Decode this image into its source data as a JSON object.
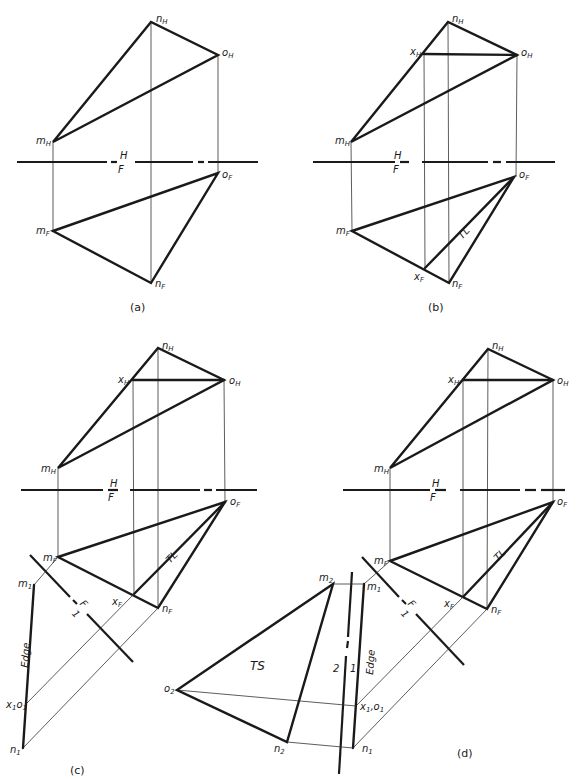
{
  "figure": {
    "panels": [
      {
        "id": "a",
        "caption": "(a)",
        "fold_line": {
          "upper": "H",
          "lower": "F"
        },
        "points": {
          "m_H": "m_H",
          "n_H": "n_H",
          "o_H": "o_H",
          "m_F": "m_F",
          "n_F": "n_F",
          "o_F": "o_F"
        }
      },
      {
        "id": "b",
        "caption": "(b)",
        "fold_line": {
          "upper": "H",
          "lower": "F"
        },
        "points": {
          "m_H": "m_H",
          "n_H": "n_H",
          "o_H": "o_H",
          "x_H": "x_H",
          "m_F": "m_F",
          "n_F": "n_F",
          "o_F": "o_F",
          "x_F": "x_F"
        },
        "annotations": {
          "true_length": "TL"
        }
      },
      {
        "id": "c",
        "caption": "(c)",
        "fold_line": {
          "upper": "H",
          "lower": "F"
        },
        "fold_line_aux": {
          "upper": "F",
          "lower": "1"
        },
        "points": {
          "m_H": "m_H",
          "n_H": "n_H",
          "o_H": "o_H",
          "x_H": "x_H",
          "m_F": "m_F",
          "n_F": "n_F",
          "o_F": "o_F",
          "x_F": "x_F",
          "m_1": "m_1",
          "x1o1": "x_1o_1",
          "n_1": "n_1"
        },
        "annotations": {
          "true_length": "TL",
          "edge": "Edge"
        }
      },
      {
        "id": "d",
        "caption": "(d)",
        "fold_line": {
          "upper": "H",
          "lower": "F"
        },
        "fold_line_aux": {
          "upper": "F",
          "lower": "1"
        },
        "fold_line_2": {
          "left": "2",
          "right": "1"
        },
        "points": {
          "m_H": "m_H",
          "n_H": "n_H",
          "o_H": "o_H",
          "x_H": "x_H",
          "m_F": "m_F",
          "n_F": "n_F",
          "o_F": "o_F",
          "x_F": "x_F",
          "m_1": "m_1",
          "x1o1": "x_1o_1",
          "n_1": "n_1",
          "m_2": "m_2",
          "n_2": "n_2",
          "o_2": "o_2"
        },
        "annotations": {
          "true_length": "TL",
          "edge": "Edge",
          "true_shape": "TS"
        }
      }
    ]
  }
}
